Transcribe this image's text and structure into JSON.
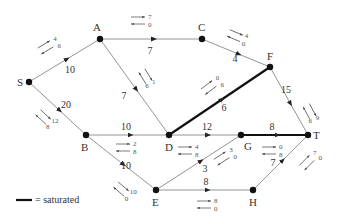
{
  "diagram": {
    "type": "flow-network",
    "legend": {
      "line_label": "= saturated",
      "saturated_color": "#111111"
    },
    "colors": {
      "edge": "#888888",
      "saturated": "#111111",
      "node": "#111111",
      "residual": "#555555"
    },
    "nodes": [
      {
        "id": "S",
        "label": "S",
        "x": 29,
        "y": 82,
        "lx": -12,
        "ly": 4
      },
      {
        "id": "A",
        "label": "A",
        "x": 100,
        "y": 39,
        "lx": -7,
        "ly": -8
      },
      {
        "id": "C",
        "label": "C",
        "x": 202,
        "y": 39,
        "lx": -4,
        "ly": -8
      },
      {
        "id": "F",
        "label": "F",
        "x": 270,
        "y": 67,
        "lx": -3,
        "ly": -7
      },
      {
        "id": "B",
        "label": "B",
        "x": 86,
        "y": 135,
        "lx": -5,
        "ly": 16
      },
      {
        "id": "D",
        "label": "D",
        "x": 169,
        "y": 135,
        "lx": -4,
        "ly": 16
      },
      {
        "id": "G",
        "label": "G",
        "x": 241,
        "y": 135,
        "lx": 3,
        "ly": 15
      },
      {
        "id": "T",
        "label": "T",
        "x": 308,
        "y": 135,
        "lx": 5,
        "ly": 4
      },
      {
        "id": "E",
        "label": "E",
        "x": 156,
        "y": 190,
        "lx": -4,
        "ly": 16
      },
      {
        "id": "H",
        "label": "H",
        "x": 253,
        "y": 190,
        "lx": -4,
        "ly": 16
      }
    ],
    "edges": [
      {
        "from": "S",
        "to": "A",
        "capacity": "10",
        "saturated": false,
        "cap_pos": [
          70,
          73
        ],
        "residual": {
          "forward": "4",
          "backward": "6",
          "pos": [
            47,
            46
          ],
          "angle": -31
        }
      },
      {
        "from": "A",
        "to": "C",
        "capacity": "7",
        "saturated": false,
        "cap_pos": [
          150,
          54
        ],
        "residual": {
          "forward": "7",
          "backward": "0",
          "pos": [
            140,
            20
          ],
          "angle": 0
        }
      },
      {
        "from": "C",
        "to": "F",
        "capacity": "4",
        "saturated": false,
        "cap_pos": [
          235,
          62
        ],
        "residual": {
          "forward": "4",
          "backward": "0",
          "pos": [
            237,
            36
          ],
          "angle": 23
        }
      },
      {
        "from": "A",
        "to": "D",
        "capacity": "7",
        "saturated": false,
        "cap_pos": [
          124,
          99
        ],
        "residual": {
          "forward": "1",
          "backward": "6",
          "pos": [
            147,
            78
          ],
          "angle": 58
        }
      },
      {
        "from": "S",
        "to": "B",
        "capacity": "20",
        "saturated": false,
        "cap_pos": [
          66,
          108
        ],
        "residual": {
          "forward": "12",
          "backward": "8",
          "pos": [
            45,
            118
          ],
          "angle": 43
        }
      },
      {
        "from": "B",
        "to": "D",
        "capacity": "10",
        "saturated": false,
        "cap_pos": [
          126,
          130
        ],
        "residual": {
          "forward": "2",
          "backward": "8",
          "pos": [
            125,
            147
          ],
          "angle": 0
        }
      },
      {
        "from": "B",
        "to": "E",
        "capacity": "10",
        "saturated": false,
        "cap_pos": [
          126,
          169
        ],
        "residual": {
          "forward": "10",
          "backward": "0",
          "pos": [
            123,
            190
          ],
          "angle": 40
        }
      },
      {
        "from": "D",
        "to": "F",
        "capacity": "6",
        "saturated": true,
        "cap_pos": [
          224,
          111
        ],
        "residual": {
          "forward": "0",
          "backward": "6",
          "pos": [
            210,
            86
          ],
          "angle": -37
        }
      },
      {
        "from": "F",
        "to": "T",
        "capacity": "15",
        "saturated": false,
        "cap_pos": [
          286,
          93
        ],
        "residual": {
          "forward": "9",
          "backward": "6",
          "pos": [
            311,
            113
          ],
          "angle": 62
        }
      },
      {
        "from": "D",
        "to": "G",
        "capacity": "12",
        "saturated": false,
        "cap_pos": [
          207,
          130
        ],
        "residual": {
          "forward": "4",
          "backward": "8",
          "pos": [
            187,
            150
          ],
          "angle": 0
        }
      },
      {
        "from": "E",
        "to": "G",
        "capacity": "3",
        "saturated": false,
        "cap_pos": [
          205,
          172
        ],
        "residual": {
          "forward": "3",
          "backward": "0",
          "pos": [
            223,
            157
          ],
          "angle": -33
        }
      },
      {
        "from": "G",
        "to": "T",
        "capacity": "8",
        "saturated": true,
        "cap_pos": [
          272,
          130
        ],
        "residual": {
          "forward": "0",
          "backward": "8",
          "pos": [
            271,
            150
          ],
          "angle": 0
        }
      },
      {
        "from": "E",
        "to": "H",
        "capacity": "8",
        "saturated": false,
        "cap_pos": [
          206,
          185
        ],
        "residual": {
          "forward": "8",
          "backward": "0",
          "pos": [
            206,
            204
          ],
          "angle": 0
        }
      },
      {
        "from": "H",
        "to": "T",
        "capacity": "7",
        "saturated": false,
        "cap_pos": [
          273,
          166
        ],
        "residual": {
          "forward": "7",
          "backward": "0",
          "pos": [
            308,
            161
          ],
          "angle": -45
        }
      }
    ]
  }
}
